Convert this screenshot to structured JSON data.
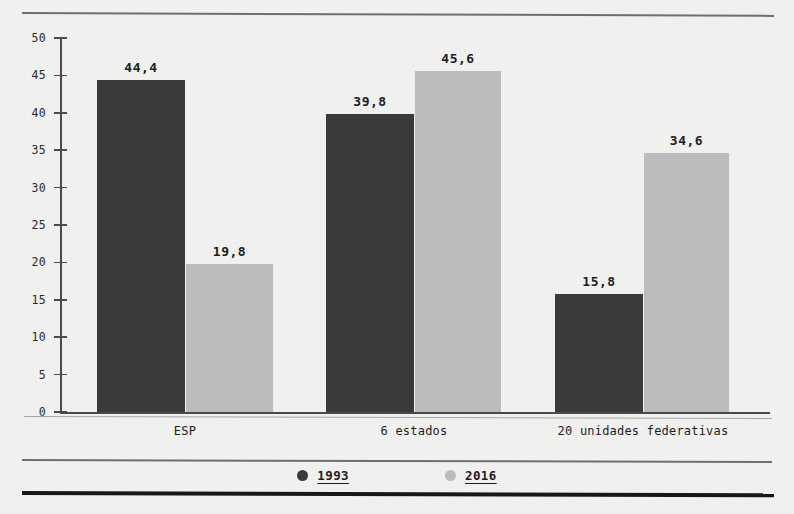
{
  "chart_data": {
    "type": "bar",
    "title": "",
    "xlabel": "",
    "ylabel": "",
    "categories": [
      "ESP",
      "6 estados",
      "20 unidades federativas"
    ],
    "series": [
      {
        "name": "1993",
        "color": "#3a3a3c",
        "values": [
          44.4,
          39.8,
          15.8
        ],
        "labels": [
          "44,4",
          "39,8",
          "15,8"
        ]
      },
      {
        "name": "2016",
        "color": "#bcbcbc",
        "values": [
          19.8,
          45.6,
          34.6
        ],
        "labels": [
          "19,8",
          "45,6",
          "34,6"
        ]
      }
    ],
    "ylim": [
      0,
      50
    ],
    "yticks": [
      0,
      5,
      10,
      15,
      20,
      25,
      30,
      35,
      40,
      45,
      50
    ],
    "ytick_labels": [
      "0",
      "5",
      "10",
      "15",
      "20",
      "25",
      "30",
      "35",
      "40",
      "45",
      "50"
    ],
    "grid": false,
    "legend_position": "bottom",
    "decimal_separator": ","
  },
  "legend": {
    "items": [
      {
        "label": "1993",
        "color": "#3a3a3c",
        "marker": "dot"
      },
      {
        "label": "2016",
        "color": "#bcbcbc",
        "marker": "dot"
      }
    ]
  },
  "colors": {
    "series_1993": "#3a3a3c",
    "series_2016": "#bcbcbc",
    "axis": "#4a4a4c",
    "rule": "#6e6e70",
    "rule_bottom": "#17171a",
    "background": "#f2f2f0",
    "text": "#1d1d1f"
  },
  "footer": {
    "clipped_text": ""
  }
}
